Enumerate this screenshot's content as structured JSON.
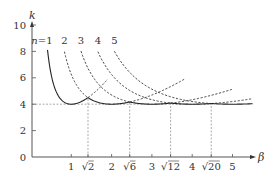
{
  "chart_data": {
    "type": "line",
    "title": "",
    "xlabel": "β",
    "ylabel": "k",
    "xlim": [
      0,
      5.5
    ],
    "ylim": [
      0,
      10
    ],
    "x_ticks": [
      {
        "value": 1,
        "label": "1"
      },
      {
        "value": 1.41421,
        "label": "√2"
      },
      {
        "value": 2,
        "label": "2"
      },
      {
        "value": 2.44949,
        "label": "√6"
      },
      {
        "value": 3,
        "label": "3"
      },
      {
        "value": 3.4641,
        "label": "√12"
      },
      {
        "value": 4,
        "label": "4"
      },
      {
        "value": 4.47214,
        "label": "√20"
      },
      {
        "value": 5,
        "label": "5"
      }
    ],
    "y_ticks": [
      0,
      2,
      4,
      6,
      8,
      10
    ],
    "formula": "k = (n/β + β/n)^2",
    "series": [
      {
        "name": "n=1",
        "label": "n=1",
        "n": 1,
        "beta_start": 0.41,
        "beta_end": 1.9,
        "solid_range": [
          0.41,
          1.41421
        ]
      },
      {
        "name": "n=2",
        "label": "2",
        "n": 2,
        "beta_start": 0.83,
        "beta_end": 3.8,
        "solid_range": [
          1.41421,
          2.44949
        ]
      },
      {
        "name": "n=3",
        "label": "3",
        "n": 3,
        "beta_start": 1.24,
        "beta_end": 5.0,
        "solid_range": [
          2.44949,
          3.4641
        ]
      },
      {
        "name": "n=4",
        "label": "4",
        "n": 4,
        "beta_start": 1.66,
        "beta_end": 5.5,
        "solid_range": [
          3.4641,
          4.47214
        ]
      },
      {
        "name": "n=5",
        "label": "5",
        "n": 5,
        "beta_start": 2.07,
        "beta_end": 5.5,
        "solid_range": [
          4.47214,
          5.5
        ]
      }
    ],
    "reference_lines": {
      "horizontal_k": 4,
      "horizontal_to_beta": 4.47214,
      "vertical_betas": [
        1.41421,
        2.44949,
        3.4641,
        4.47214
      ]
    },
    "minima": [
      {
        "beta": 1,
        "k": 4
      },
      {
        "beta": 2,
        "k": 4
      },
      {
        "beta": 3,
        "k": 4
      },
      {
        "beta": 4,
        "k": 4
      },
      {
        "beta": 5,
        "k": 4
      }
    ],
    "grid": false,
    "legend": "inline curve labels at top of each curve"
  }
}
